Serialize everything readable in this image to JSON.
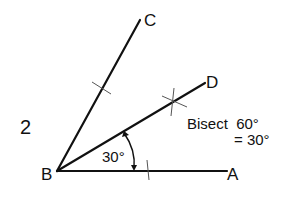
{
  "figure_number": "2",
  "points": {
    "A": "A",
    "B": "B",
    "C": "C",
    "D": "D"
  },
  "angle_label": "30°",
  "note": {
    "line1": "Bisect  60°",
    "line2": "= 30°"
  }
}
